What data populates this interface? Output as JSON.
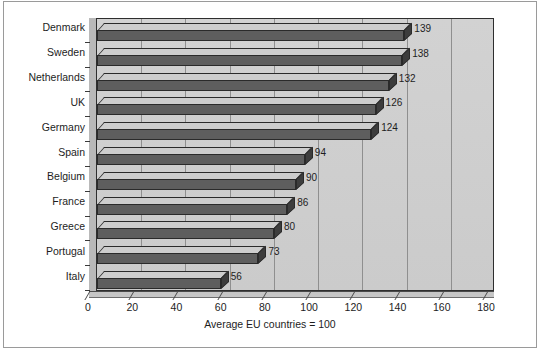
{
  "chart_data": {
    "type": "bar",
    "orientation": "horizontal",
    "title": "",
    "subtitle": "",
    "xlabel": "",
    "ylabel": "",
    "caption": "Average EU countries = 100",
    "xlim": [
      0,
      180
    ],
    "xticks": [
      0,
      20,
      40,
      60,
      80,
      100,
      120,
      140,
      160,
      180
    ],
    "xtick_labels": [
      "0",
      "20",
      "40",
      "60",
      "80",
      "100",
      "120",
      "140",
      "160",
      "180"
    ],
    "grid": true,
    "grid_axis": "x",
    "legend": false,
    "categories": [
      "Denmark",
      "Sweden",
      "Netherlands",
      "UK",
      "Germany",
      "Spain",
      "Belgium",
      "France",
      "Greece",
      "Portugal",
      "Italy"
    ],
    "values": [
      139,
      138,
      132,
      126,
      124,
      94,
      90,
      86,
      80,
      73,
      56
    ],
    "data_labels": [
      "139",
      "138",
      "132",
      "126",
      "124",
      "94",
      "90",
      "86",
      "80",
      "73",
      "56"
    ],
    "colors": {
      "bar_front": "#5e5e5e",
      "bar_top": "#cdcdcd",
      "bar_side": "#3d3d3d",
      "bar_outline": "#2a2a2a",
      "plot_background": "#cfcfcf",
      "gridline": "#8f8f8f",
      "axis": "#4a4a4a",
      "text": "#1d1d1d",
      "figure_background": "#ffffff",
      "figure_border": "#9a9a9a"
    }
  }
}
